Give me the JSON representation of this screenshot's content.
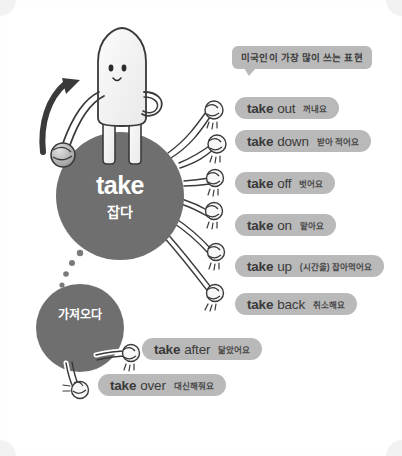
{
  "page": {
    "background_color": "#ffffff",
    "accent_gray": "#6f6f6f",
    "pill_color": "#b9b9b9",
    "ink_color": "#3a3a3a"
  },
  "bubble": {
    "text": "미국인이 가장 많이 쓰는 표현"
  },
  "nodes": {
    "main": {
      "word": "take",
      "meaning": "잡다"
    },
    "sub": {
      "meaning": "가져오다"
    }
  },
  "phrases": [
    {
      "verb": "take",
      "particle": "out",
      "meaning": "꺼내요"
    },
    {
      "verb": "take",
      "particle": "down",
      "meaning": "받아 적어요"
    },
    {
      "verb": "take",
      "particle": "off",
      "meaning": "벗어요"
    },
    {
      "verb": "take",
      "particle": "on",
      "meaning": "맡아요"
    },
    {
      "verb": "take",
      "particle": "up",
      "meaning": "(시간을) 잡아먹어요"
    },
    {
      "verb": "take",
      "particle": "back",
      "meaning": "취소해요"
    },
    {
      "verb": "take",
      "particle": "after",
      "meaning": "닮았어요"
    },
    {
      "verb": "take",
      "particle": "over",
      "meaning": "대신해줘요"
    }
  ]
}
